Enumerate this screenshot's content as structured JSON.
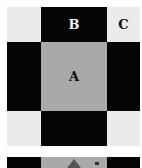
{
  "diagram": {
    "title": "",
    "grid": {
      "rows": 3,
      "cols": 3,
      "cells": [
        {
          "row": 0,
          "col": 0,
          "fill": "light",
          "label": ""
        },
        {
          "row": 0,
          "col": 1,
          "fill": "dark",
          "label": "B"
        },
        {
          "row": 0,
          "col": 2,
          "fill": "light",
          "label": "C"
        },
        {
          "row": 1,
          "col": 0,
          "fill": "dark",
          "label": ""
        },
        {
          "row": 1,
          "col": 1,
          "fill": "mid",
          "label": "A"
        },
        {
          "row": 1,
          "col": 2,
          "fill": "dark",
          "label": ""
        },
        {
          "row": 2,
          "col": 0,
          "fill": "light",
          "label": ""
        },
        {
          "row": 2,
          "col": 1,
          "fill": "dark",
          "label": ""
        },
        {
          "row": 2,
          "col": 2,
          "fill": "light",
          "label": ""
        }
      ]
    },
    "labels": {
      "a": "A",
      "b": "B",
      "c": "C"
    },
    "bottom_strip": {
      "segments": [
        "dark",
        "mid",
        "dark"
      ],
      "has_triangle_marker": true
    },
    "colors": {
      "light": "#ebebeb",
      "dark": "#050505",
      "mid": "#a9a9a9"
    }
  }
}
